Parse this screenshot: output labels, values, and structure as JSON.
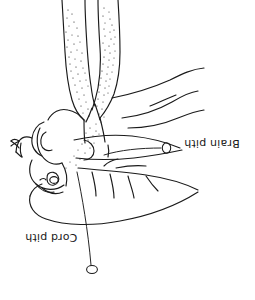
{
  "figure": {
    "orientation": "rotated-180",
    "background_color": "#ffffff",
    "ink_color": "#1a1a1a",
    "labels": [
      {
        "id": "brain-pith",
        "text": "Brain pith",
        "marker": "small-ellipse",
        "marker_x": 166,
        "marker_y": 148
      },
      {
        "id": "cord-pith",
        "text": "Cord pith",
        "marker": "small-ellipse",
        "marker_x": 92,
        "marker_y": 270
      }
    ]
  }
}
